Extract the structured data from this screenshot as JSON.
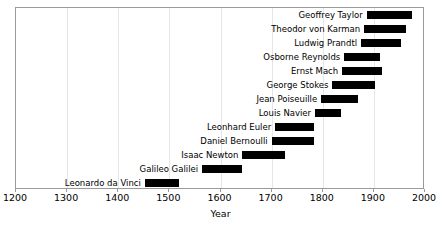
{
  "chart_data": {
    "type": "bar",
    "orientation": "horizontal",
    "subtype": "timeline-gantt",
    "title": "",
    "xlabel": "Year",
    "ylabel": "",
    "xlim": [
      1200,
      2000
    ],
    "xticks": [
      1200,
      1300,
      1400,
      1500,
      1600,
      1700,
      1800,
      1900,
      2000
    ],
    "xtick_labels": [
      "1200",
      "1300",
      "1400",
      "1500",
      "1600",
      "1700",
      "1800",
      "1900",
      "2000"
    ],
    "grid": "vertical",
    "legend": "none",
    "bar_color": "#000000",
    "categories": [
      "Geoffrey Taylor",
      "Theodor von Karman",
      "Ludwig Prandtl",
      "Osborne Reynolds",
      "Ernst Mach",
      "George Stokes",
      "Jean Poiseuille",
      "Louis Navier",
      "Leonhard Euler",
      "Daniel Bernoulli",
      "Isaac Newton",
      "Galileo Galilei",
      "Leonardo da Vinci"
    ],
    "bars": [
      {
        "label": "Geoffrey Taylor",
        "start": 1886,
        "end": 1975
      },
      {
        "label": "Theodor von Karman",
        "start": 1881,
        "end": 1963
      },
      {
        "label": "Ludwig Prandtl",
        "start": 1875,
        "end": 1953
      },
      {
        "label": "Osborne Reynolds",
        "start": 1842,
        "end": 1912
      },
      {
        "label": "Ernst Mach",
        "start": 1838,
        "end": 1916
      },
      {
        "label": "George Stokes",
        "start": 1819,
        "end": 1903
      },
      {
        "label": "Jean Poiseuille",
        "start": 1797,
        "end": 1869
      },
      {
        "label": "Louis Navier",
        "start": 1785,
        "end": 1836
      },
      {
        "label": "Leonhard Euler",
        "start": 1707,
        "end": 1783
      },
      {
        "label": "Daniel Bernoulli",
        "start": 1700,
        "end": 1782
      },
      {
        "label": "Isaac Newton",
        "start": 1643,
        "end": 1727
      },
      {
        "label": "Galileo Galilei",
        "start": 1564,
        "end": 1642
      },
      {
        "label": "Leonardo da Vinci",
        "start": 1452,
        "end": 1519
      }
    ]
  },
  "axis": {
    "x_title": "Year"
  }
}
